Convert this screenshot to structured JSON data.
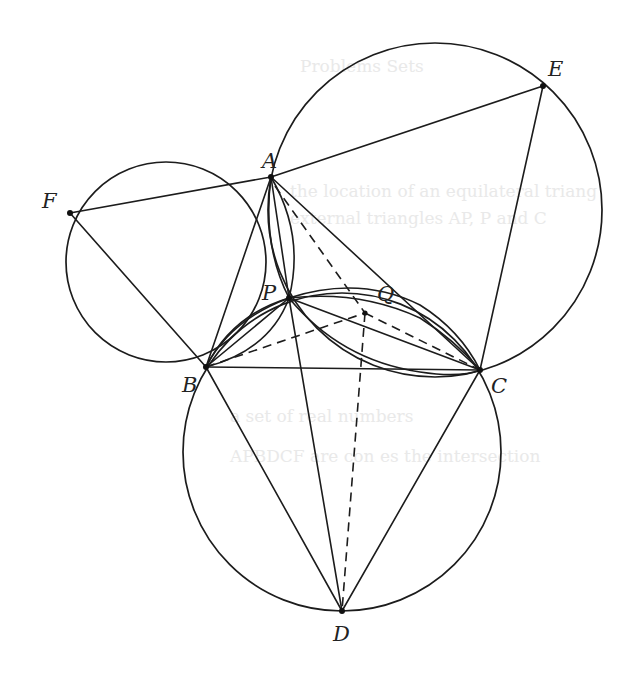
{
  "figure": {
    "points": {
      "A": {
        "label": "A"
      },
      "B": {
        "label": "B"
      },
      "C": {
        "label": "C"
      },
      "D": {
        "label": "D"
      },
      "E": {
        "label": "E"
      },
      "F": {
        "label": "F"
      },
      "P": {
        "label": "P"
      },
      "Q": {
        "label": "Q"
      }
    },
    "segments_solid": [
      "AB",
      "AC",
      "BC",
      "AF",
      "BF",
      "AE",
      "CE",
      "BD",
      "CD",
      "PD",
      "AP",
      "PB",
      "PC"
    ],
    "segments_dashed": [
      "AC-dash",
      "BX",
      "XC",
      "XD"
    ],
    "circles": [
      "circle-ABF",
      "circle-ACE",
      "circle-BCD",
      "circle-PBC"
    ],
    "background_showthrough": {
      "heading": "Problems Sets",
      "line1": "the location of an equilateral triang",
      "line2": "external triangles AP, P and C",
      "line3": "a set of real numbers",
      "line4": "APBDCF are con es the intersection"
    }
  }
}
